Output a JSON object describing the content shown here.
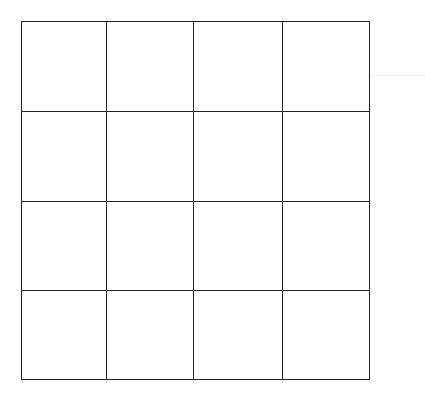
{
  "grid": {
    "rows": 4,
    "cols": 4,
    "x_lines": [
      21,
      106,
      193,
      282,
      368
    ],
    "y_lines": [
      21,
      111,
      201,
      290,
      378
    ],
    "line_color": "#222222",
    "cell_fill": "#ffffff",
    "background": "#ffffff"
  }
}
